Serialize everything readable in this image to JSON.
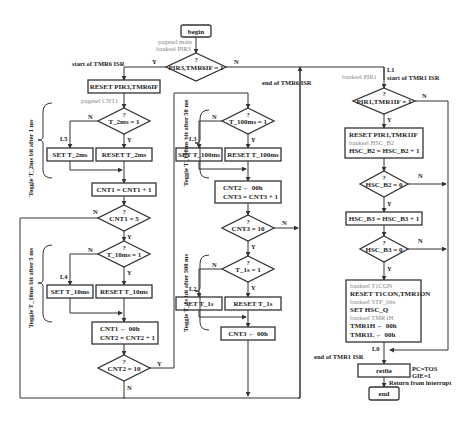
{
  "diagram": {
    "begin": "begin",
    "end": "end",
    "pre_begin_notes": [
      "pagesel main",
      "banksel PIR3"
    ],
    "q": "?",
    "yes": "Y",
    "no": "N",
    "decision_main": "PIR3,TMR6IF = 1",
    "tmr6": {
      "start_label": "start of TMR6 ISR",
      "end_label": "end of TMR6 ISR",
      "reset_flag": "RESET  PIR3,TMR6IF",
      "pagesel_note": "pagesel CNT1",
      "t2ms_decision": "T_2ms = 1",
      "set_t2ms": "SET  T_2ms",
      "reset_t2ms": "RESET  T_2ms",
      "label_l5": "L5",
      "cnt1_inc": "CNT1 = CNT1 + 1",
      "cnt1_decision": "CNT1 = 5",
      "t10ms_decision": "T_10ms = 1",
      "set_t10ms": "SET  T_10ms",
      "reset_t10ms": "RESET  T_10ms",
      "label_l4": "L4",
      "cnt1_clear_line1": "CNT1  ← 00h",
      "cnt1_clear_line2": "CNT2 = CNT2 + 1",
      "cnt2_decision": "CNT2 = 10",
      "t100ms_decision": "T_100ms = 1",
      "set_t100ms": "SET  T_100ms",
      "reset_t100ms": "RESET  T_100ms",
      "label_l3": "L3",
      "cnt2_clear_line1": "CNT2  ← 00h",
      "cnt2_clear_line2": "CNT3 = CNT3 + 1",
      "cnt3_decision": "CNT3 = 10",
      "t1s_decision": "T_1s = 1",
      "set_t1s": "SET  T_1s",
      "reset_t1s": "RESET  T_1s",
      "label_l2": "L2",
      "cnt3_clear": "CNT3 ← 00h",
      "brace_2ms": "Toggle T_2ms bit after 1 ms",
      "brace_10ms": "Toggle T_10ms bit after 5 ms",
      "brace_100ms": "Toggle T_100ms bit after 50 ms",
      "brace_1s": "Toggle T_1s bit after 500 ms"
    },
    "tmr1": {
      "label_l1": "L1",
      "start_label": "start of TMR1 ISR",
      "banksel_note": "banksel PIR1",
      "decision": "PIR1,TMR1IF = 1",
      "reset_box": [
        "RESET  PIR1,TMR1IF",
        "banksel HSC_B2",
        "HSC_B2 = HSC_B2 + 1"
      ],
      "hscb2_decision": "HSC_B2 = 0",
      "hscb3_inc": "HSC_B3 = HSC_B3 + 1",
      "hscb3_decision": "HSC_B3 = 0",
      "final_box": [
        "banksel T1CON",
        "RESET  T1CON,TMR1ON",
        "banksel STP_bits",
        "SET  HSC_Q",
        "banksel TMR1H",
        "TMR1H ← 00h",
        "TMR1L ← 00h"
      ],
      "label_l0": "L0",
      "end_label": "end of TMR1 ISR",
      "retfie": "retfie",
      "retfie_notes": [
        "PC=TOS",
        "GIE=1"
      ],
      "return_note": "Return from interrupt"
    }
  }
}
